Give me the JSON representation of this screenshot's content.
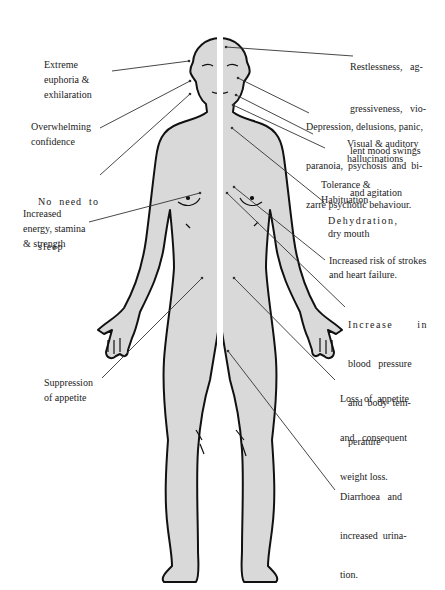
{
  "diagram": {
    "colors": {
      "body_fill": "#d9d9d9",
      "outline": "#111111",
      "leader": "#333333",
      "background": "#ffffff"
    },
    "left_labels": [
      {
        "id": "euphoria",
        "lines": [
          "Extreme",
          "euphoria &",
          "exhilaration"
        ]
      },
      {
        "id": "confidence",
        "lines": [
          "Overwhelming",
          "confidence"
        ]
      },
      {
        "id": "sleep",
        "lines": [
          "No  need  to",
          "sleep"
        ]
      },
      {
        "id": "energy",
        "lines": [
          "Increased",
          "energy, stamina",
          "& strength"
        ]
      },
      {
        "id": "appetite-suppression",
        "lines": [
          "Suppression",
          "of appetite"
        ]
      }
    ],
    "right_labels": [
      {
        "id": "restlessness",
        "lines": [
          "Restlessness,   ag-",
          "gressiveness,   vio-",
          "lent mood swings",
          "and agitation"
        ]
      },
      {
        "id": "depression",
        "lines": [
          "Depression, delusions, panic,",
          "paranoia,  psychosis  and  bi-",
          "zarre psychotic behaviour."
        ]
      },
      {
        "id": "hallucinations",
        "lines": [
          "Visual & auditory",
          "hallucinations"
        ]
      },
      {
        "id": "tolerance",
        "lines": [
          "Tolerance &",
          "Habituation"
        ]
      },
      {
        "id": "dehydration",
        "lines": [
          "Dehydration,",
          "dry mouth"
        ]
      },
      {
        "id": "strokes",
        "lines": [
          "Increased risk of strokes",
          "and heart failure."
        ]
      },
      {
        "id": "blood-pressure",
        "lines": [
          "Increase      in",
          "blood   pressure",
          "and  body  tem-",
          "perature"
        ]
      },
      {
        "id": "appetite-loss",
        "lines": [
          "Loss  of  appetite",
          "and   consequent",
          "weight loss."
        ]
      },
      {
        "id": "diarrhoea",
        "lines": [
          "Diarrhoea   and",
          "increased  urina-",
          "tion."
        ]
      }
    ]
  }
}
